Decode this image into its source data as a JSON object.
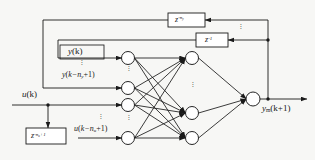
{
  "figure": {
    "type": "block-diagram"
  },
  "labels": {
    "delay_top": {
      "base": "z",
      "exp_prefix": "-n",
      "exp_sub": "y"
    },
    "delay_unit": {
      "base": "z",
      "exp_prefix": "-1",
      "exp_sub": ""
    },
    "delay_bottom": {
      "base": "z",
      "exp_prefix": "-n",
      "exp_sub": "u",
      "exp_suffix": "+1"
    },
    "y_current": {
      "fn": "y",
      "arg": "(k)"
    },
    "y_delayed": {
      "fn": "y",
      "arg_open": "(k",
      "arg_minus": "−n",
      "arg_sub": "y",
      "arg_close": "+1)"
    },
    "u_current": {
      "fn": "u",
      "arg": "(k)"
    },
    "u_delayed": {
      "fn": "u",
      "arg_open": "(k",
      "arg_minus": "−n",
      "arg_sub": "u",
      "arg_close": "+1)"
    },
    "output": {
      "fn": "y",
      "sub": "m",
      "arg": "(k+1)"
    }
  },
  "vertical_ellipsis": "·",
  "nodes": {
    "input_layer": [
      {
        "id": "in-1",
        "cx": 128,
        "cy": 58
      },
      {
        "id": "in-2",
        "cx": 128,
        "cy": 88
      },
      {
        "id": "in-3",
        "cx": 128,
        "cy": 105
      },
      {
        "id": "in-4",
        "cx": 128,
        "cy": 138
      }
    ],
    "hidden_layer": [
      {
        "id": "hid-1",
        "cx": 192,
        "cy": 58
      },
      {
        "id": "hid-2",
        "cx": 192,
        "cy": 113
      },
      {
        "id": "hid-3",
        "cx": 192,
        "cy": 138
      }
    ],
    "output_layer": [
      {
        "id": "out-1",
        "cx": 253,
        "cy": 99
      }
    ],
    "radius": 6.5
  },
  "colors": {
    "stroke": "#1a1a1a",
    "node_fill": "#ffffff",
    "background": "#f7f7f5",
    "text": "#1a1a1a"
  }
}
